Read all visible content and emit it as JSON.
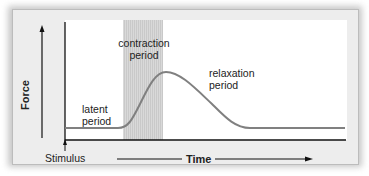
{
  "diagram": {
    "y_axis_label": "Force",
    "x_axis_label": "Time",
    "stimulus_label": "Stimulus",
    "phases": [
      {
        "label_line1": "latent",
        "label_line2": "period"
      },
      {
        "label_line1": "contraction",
        "label_line2": "period"
      },
      {
        "label_line1": "relaxation",
        "label_line2": "period"
      }
    ],
    "colors": {
      "curve": "#808080",
      "shaded_band": "#d6d6d6",
      "axes": "#111111",
      "panel": "#ededed"
    }
  }
}
